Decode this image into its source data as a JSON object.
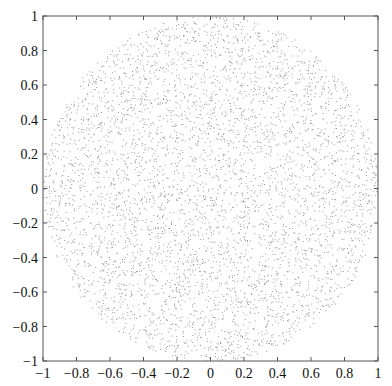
{
  "chart_data": {
    "type": "scatter",
    "title": "",
    "xlabel": "",
    "ylabel": "",
    "xlim": [
      -1,
      1
    ],
    "ylim": [
      -1,
      1
    ],
    "grid": false,
    "legend": null,
    "point_count_estimate": 5000,
    "marker": {
      "shape": "dot",
      "size_px": 1,
      "color": "#7a7a7a"
    },
    "region": {
      "shape": "circle",
      "center": [
        0,
        0
      ],
      "radius": 1
    },
    "x_ticks": [
      -1,
      -0.8,
      -0.6,
      -0.4,
      -0.2,
      0,
      0.2,
      0.4,
      0.6,
      0.8,
      1
    ],
    "y_ticks": [
      -1,
      -0.8,
      -0.6,
      -0.4,
      -0.2,
      0,
      0.2,
      0.4,
      0.6,
      0.8,
      1
    ],
    "x_tick_labels": [
      "−1",
      "−0.8",
      "−0.6",
      "−0.4",
      "−0.2",
      "0",
      "0.2",
      "0.4",
      "0.6",
      "0.8",
      "1"
    ],
    "y_tick_labels": [
      "−1",
      "−0.8",
      "−0.6",
      "−0.4",
      "−0.2",
      "0",
      "0.2",
      "0.4",
      "0.6",
      "0.8",
      "1"
    ]
  },
  "colors": {
    "axis": "#555555",
    "points": "#7a7a7a",
    "text": "#111111",
    "background": "#ffffff"
  }
}
